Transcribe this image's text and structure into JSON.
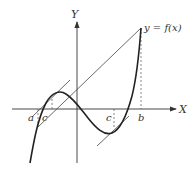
{
  "diagram": {
    "axes": {
      "x_label": "X",
      "y_label": "Y"
    },
    "curve_label": "y = f(x)",
    "points": {
      "a": "a",
      "b": "b",
      "c1": "c",
      "c2": "c"
    },
    "colors": {
      "curve": "#222222",
      "axes": "#333333",
      "lines": "#444444",
      "dashed": "#555555"
    }
  }
}
